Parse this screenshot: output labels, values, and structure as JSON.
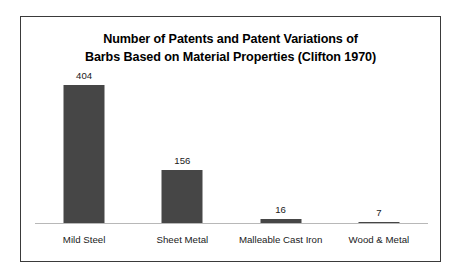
{
  "chart_data": {
    "type": "bar",
    "title": "Number of Patents and Patent Variations of Barbs Based on Material Properties (Clifton 1970)",
    "title_lines": [
      "Number of Patents and Patent Variations of",
      "Barbs Based on Material Properties (Clifton 1970)"
    ],
    "categories": [
      "Mild Steel",
      "Sheet Metal",
      "Malleable Cast Iron",
      "Wood & Metal"
    ],
    "values": [
      404,
      156,
      16,
      7
    ],
    "value_labels": [
      "404",
      "156",
      "16",
      "7"
    ],
    "xlabel": "",
    "ylabel": "",
    "ylim": [
      0,
      440
    ],
    "grid": false,
    "legend": false,
    "axis_visible": {
      "x": true,
      "y": false
    },
    "bar_color": "#464646",
    "axis_color": "#b8b8b8",
    "border_color": "#3a3a3a",
    "background_color": "#ffffff",
    "text_color": "#1a1a1a"
  }
}
